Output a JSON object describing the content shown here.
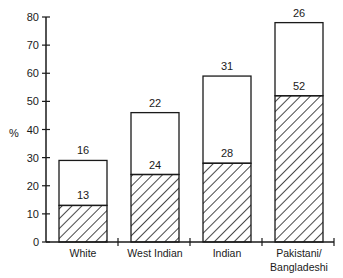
{
  "chart_data": {
    "type": "bar",
    "stacked": true,
    "title": "",
    "xlabel": "",
    "ylabel": "%",
    "ylim": [
      0,
      80
    ],
    "yticks": [
      0,
      10,
      20,
      30,
      40,
      50,
      60,
      70,
      80
    ],
    "categories": [
      "White",
      "West Indian",
      "Indian",
      "Pakistani/ Bangladeshi"
    ],
    "category_lines": [
      [
        "White"
      ],
      [
        "West Indian"
      ],
      [
        "Indian"
      ],
      [
        "Pakistani/",
        "Bangladeshi"
      ]
    ],
    "series": [
      {
        "name": "hatched (lower segment)",
        "pattern": "diagonal-hatch",
        "values": [
          13,
          24,
          28,
          52
        ]
      },
      {
        "name": "open (upper segment)",
        "pattern": "none",
        "values": [
          16,
          22,
          31,
          26
        ]
      }
    ],
    "segment_labels": {
      "lower": [
        "13",
        "24",
        "28",
        "52"
      ],
      "upper": [
        "16",
        "22",
        "31",
        "26"
      ]
    },
    "grid": false,
    "legend": null
  },
  "axis": {
    "y_label": "%",
    "tick_labels": [
      "0",
      "10",
      "20",
      "30",
      "40",
      "50",
      "60",
      "70",
      "80"
    ]
  },
  "colors": {
    "ink": "#1a1a1a",
    "background": "#ffffff"
  }
}
